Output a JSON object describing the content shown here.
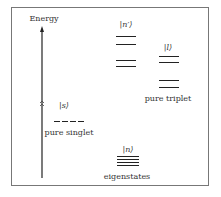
{
  "diagram": {
    "y_axis_label": "Energy",
    "groups": [
      {
        "id": "singlet",
        "ket": "|s⟩",
        "caption": "pure singlet",
        "levels": [
          [
            80,
            118,
            true
          ]
        ]
      },
      {
        "id": "eigen",
        "ket": "|n⟩",
        "caption": "eigenstates",
        "levels": [
          [
            118,
            140,
            false
          ],
          [
            118,
            140,
            false
          ],
          [
            118,
            140,
            false
          ],
          [
            118,
            140,
            false
          ]
        ]
      },
      {
        "id": "nprime",
        "ket": "|n′⟩",
        "caption": "",
        "levels": [
          [
            116,
            136,
            false
          ],
          [
            116,
            136,
            false
          ],
          [
            116,
            136,
            false
          ],
          [
            116,
            136,
            false
          ]
        ]
      },
      {
        "id": "triplet",
        "ket": "|l⟩",
        "caption": "pure triplet",
        "levels": [
          [
            159,
            179,
            false
          ],
          [
            159,
            179,
            false
          ],
          [
            159,
            179,
            false
          ],
          [
            159,
            179,
            false
          ]
        ]
      }
    ],
    "colors": {
      "line": "#222222",
      "frame": "#777777"
    }
  }
}
